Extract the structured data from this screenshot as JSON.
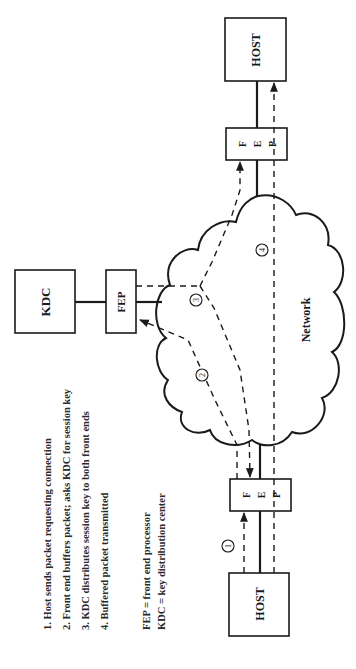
{
  "diagram": {
    "orientation": "rotated-90-ccw",
    "nodes": {
      "kdc": {
        "label": "KDC"
      },
      "kdc_fep": {
        "label": "FEP"
      },
      "host_top": {
        "label": "HOST"
      },
      "fep_top": {
        "letters": [
          "F",
          "E",
          "P"
        ]
      },
      "fep_bottom": {
        "letters": [
          "F",
          "E",
          "P"
        ]
      },
      "host_bottom": {
        "label": "HOST"
      },
      "network": {
        "label": "Network"
      }
    },
    "step_markers": [
      "1",
      "2",
      "3",
      "4"
    ],
    "steps": [
      "1. Host sends packet requesting connection",
      "2. Front end buffers packet; asks KDC for session key",
      "3. KDC distributes session key to both front ends",
      "4. Buffered packet transmitted"
    ],
    "legend": [
      "FEP  = front end processor",
      "KDC = key distribution center"
    ]
  }
}
